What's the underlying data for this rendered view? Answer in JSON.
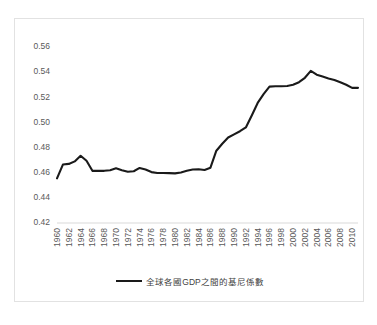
{
  "chart_data": {
    "type": "line",
    "title": "",
    "subtitle": "",
    "xlabel": "",
    "ylabel": "",
    "grid": false,
    "legend_position": "bottom",
    "ylim": [
      0.42,
      0.56
    ],
    "yticks": [
      "0.42",
      "0.44",
      "0.46",
      "0.48",
      "0.50",
      "0.52",
      "0.54",
      "0.56"
    ],
    "ytick_values": [
      0.42,
      0.44,
      0.46,
      0.48,
      0.5,
      0.52,
      0.54,
      0.56
    ],
    "xlim": [
      1960,
      2011
    ],
    "xticks": [
      "1960",
      "1962",
      "1964",
      "1966",
      "1968",
      "1970",
      "1972",
      "1974",
      "1976",
      "1978",
      "1980",
      "1982",
      "1984",
      "1986",
      "1988",
      "1990",
      "1992",
      "1994",
      "1996",
      "1998",
      "2000",
      "2002",
      "2004",
      "2006",
      "2008",
      "2010"
    ],
    "series": [
      {
        "name": "全球各國GDP之間的基尼係數",
        "color": "#1a1a1a",
        "x": [
          1960,
          1961,
          1962,
          1963,
          1964,
          1965,
          1966,
          1967,
          1968,
          1969,
          1970,
          1971,
          1972,
          1973,
          1974,
          1975,
          1976,
          1977,
          1978,
          1979,
          1980,
          1981,
          1982,
          1983,
          1984,
          1985,
          1986,
          1987,
          1988,
          1989,
          1990,
          1991,
          1992,
          1993,
          1994,
          1995,
          1996,
          1997,
          1998,
          1999,
          2000,
          2001,
          2002,
          2003,
          2004,
          2005,
          2006,
          2007,
          2008,
          2009,
          2010,
          2011
        ],
        "values": [
          0.4555,
          0.4665,
          0.467,
          0.469,
          0.4735,
          0.4695,
          0.4615,
          0.4615,
          0.4615,
          0.462,
          0.4635,
          0.462,
          0.4608,
          0.4612,
          0.4638,
          0.4625,
          0.4605,
          0.4598,
          0.4598,
          0.4597,
          0.4595,
          0.4602,
          0.4615,
          0.4625,
          0.4628,
          0.4622,
          0.464,
          0.4775,
          0.483,
          0.488,
          0.4905,
          0.493,
          0.496,
          0.5055,
          0.5155,
          0.5225,
          0.5285,
          0.5288,
          0.5288,
          0.529,
          0.53,
          0.532,
          0.5355,
          0.541,
          0.538,
          0.5365,
          0.535,
          0.5338,
          0.532,
          0.53,
          0.5275,
          0.5275
        ]
      }
    ]
  },
  "legend": {
    "label": "全球各國GDP之間的基尼係數"
  }
}
